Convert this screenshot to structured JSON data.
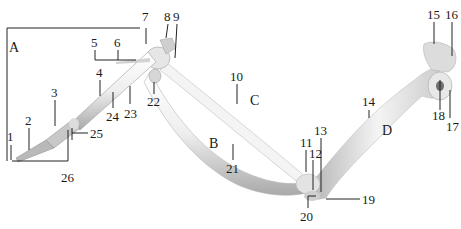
{
  "diagram": {
    "colors": {
      "bone_fill": "#f2f2f2",
      "bone_shade": "#b8b8b8",
      "bone_dark": "#8a8a8a",
      "line": "#222222",
      "text": "#1a1a1a"
    },
    "regions": [
      {
        "id": "A",
        "label": "A"
      },
      {
        "id": "B",
        "label": "B"
      },
      {
        "id": "C",
        "label": "C"
      },
      {
        "id": "D",
        "label": "D"
      }
    ],
    "labels": {
      "n1": "1",
      "n2": "2",
      "n3": "3",
      "n4": "4",
      "n5": "5",
      "n6": "6",
      "n7": "7",
      "n8": "8",
      "n9": "9",
      "n10": "10",
      "n11": "11",
      "n12": "12",
      "n13": "13",
      "n14": "14",
      "n15": "15",
      "n16": "16",
      "n17": "17",
      "n18": "18",
      "n19": "19",
      "n20": "20",
      "n21": "21",
      "n22": "22",
      "n23": "23",
      "n24": "24",
      "n25": "25",
      "n26": "26"
    }
  }
}
